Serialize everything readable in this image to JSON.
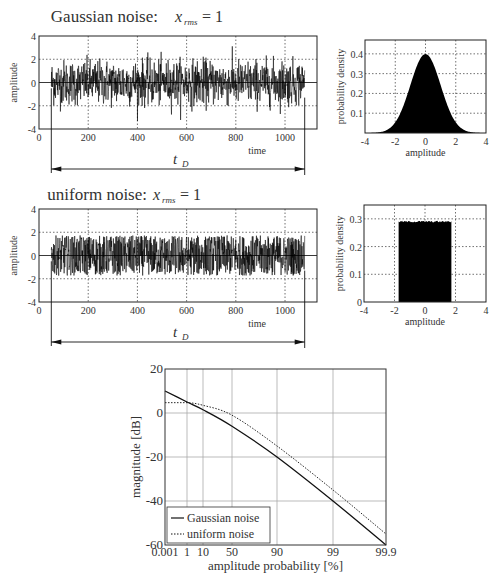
{
  "chart_data": [
    {
      "id": "gaussian-time",
      "type": "line",
      "title": "Gaussian noise:",
      "title_math": "x_rms = 1",
      "xlabel": "time",
      "ylabel": "amplitude",
      "xlim": [
        0,
        1130
      ],
      "ylim": [
        -4,
        4
      ],
      "xticks": [
        "0",
        "200",
        "400",
        "600",
        "800",
        "1000"
      ],
      "yticks": [
        "4",
        "2",
        "0",
        "-2",
        "-4"
      ],
      "grid": true,
      "signal_range": [
        50,
        1080
      ],
      "distribution": "gaussian",
      "rms": 1,
      "peak_range": [
        -3.4,
        3.2
      ],
      "annotation": "t_D"
    },
    {
      "id": "gaussian-pdf",
      "type": "area",
      "xlabel": "amplitude",
      "ylabel": "probability density",
      "xlim": [
        -4,
        4
      ],
      "ylim": [
        0,
        0.47
      ],
      "xticks": [
        "-4",
        "-2",
        "0",
        "2",
        "4"
      ],
      "yticks": [
        "0.4",
        "0.3",
        "0.2",
        "0.1"
      ],
      "grid": true,
      "peak": 0.4,
      "distribution": "gaussian"
    },
    {
      "id": "uniform-time",
      "type": "line",
      "title": "uniform noise:",
      "title_math": "x_rms = 1",
      "xlabel": "time",
      "ylabel": "amplitude",
      "xlim": [
        0,
        1130
      ],
      "ylim": [
        -4,
        4
      ],
      "xticks": [
        "0",
        "200",
        "400",
        "600",
        "800",
        "1000"
      ],
      "yticks": [
        "4",
        "2",
        "0",
        "-2",
        "-4"
      ],
      "grid": true,
      "signal_range": [
        50,
        1080
      ],
      "distribution": "uniform",
      "rms": 1,
      "peak_range": [
        -1.73,
        1.73
      ],
      "annotation": "t_D"
    },
    {
      "id": "uniform-pdf",
      "type": "area",
      "xlabel": "amplitude",
      "ylabel": "probability density",
      "xlim": [
        -4,
        4
      ],
      "ylim": [
        0,
        0.35
      ],
      "xticks": [
        "-4",
        "-2",
        "0",
        "2",
        "4"
      ],
      "yticks": [
        "0.3",
        "0.2",
        "0.1",
        "0"
      ],
      "grid": true,
      "x_range": [
        -1.73,
        1.73
      ],
      "height": 0.29,
      "distribution": "uniform"
    },
    {
      "id": "amplitude-probability",
      "type": "line",
      "xlabel": "amplitude probability [%]",
      "ylabel": "magnitude [dB]",
      "ylim": [
        -60,
        20
      ],
      "xticks": [
        "0.001",
        "1",
        "10",
        "50",
        "90",
        "99",
        "99.9"
      ],
      "yticks": [
        "20",
        "0",
        "-20",
        "-40",
        "-60"
      ],
      "grid": true,
      "legend_position": "lower left",
      "categories": [
        "0.001",
        "1",
        "10",
        "50",
        "90",
        "99",
        "99.9"
      ],
      "series": [
        {
          "name": "Gaussian noise",
          "style": "solid",
          "values": [
            10,
            5,
            1.5,
            -6,
            -20,
            -40,
            -60
          ]
        },
        {
          "name": "uniform noise",
          "style": "dotted",
          "values": [
            4.7,
            4.7,
            3.5,
            -1,
            -15,
            -35,
            -55
          ]
        }
      ]
    }
  ],
  "labels": {
    "title1": "Gaussian noise:",
    "title2": "uniform noise:",
    "xrms_x": "x",
    "xrms_sub": "rms",
    "xrms_eq": "= 1",
    "amplitude": "amplitude",
    "time": "time",
    "pdf": "probability density",
    "tD": "t",
    "tD_sub": "D",
    "magnitude": "magnitude [dB]",
    "ampprob": "amplitude probability [%]",
    "legend_gauss": "Gaussian noise",
    "legend_uniform": "uniform noise"
  }
}
